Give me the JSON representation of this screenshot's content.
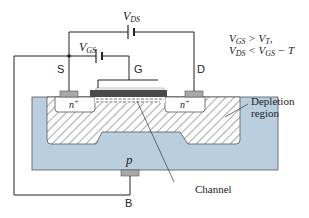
{
  "diagram": {
    "sources": {
      "vds": {
        "label": "V",
        "sub": "DS"
      },
      "vgs": {
        "label": "V",
        "sub": "GS"
      }
    },
    "conditions": {
      "line1": {
        "a": "V",
        "a_sub": "GS",
        "op": " > ",
        "b": "V",
        "b_sub": "T",
        "tail": ","
      },
      "line2": {
        "a": "V",
        "a_sub": "DS",
        "op": " < ",
        "b": "V",
        "b_sub": "GS",
        "tail": " − T"
      }
    },
    "terminals": {
      "source": "S",
      "gate": "G",
      "drain": "D",
      "body": "B"
    },
    "regions": {
      "source_n": "n",
      "drain_n": "n",
      "n_sup": "+",
      "substrate": "p"
    },
    "annotations": {
      "depletion_line1": "Depletion",
      "depletion_line2": "region",
      "channel": "Channel"
    },
    "colors": {
      "substrate": "#b9cfe0",
      "gate": "#4a4a4a",
      "contact": "#a8a8a8",
      "wire": "#222222"
    }
  }
}
